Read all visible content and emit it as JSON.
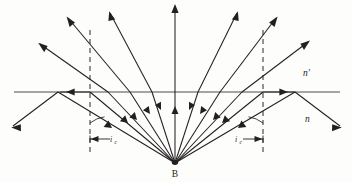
{
  "figure": {
    "background_color": "#fdfdfc",
    "ink_color": "#231f20",
    "interface_color": "#4d4d4f"
  },
  "labels": {
    "source_point": "B",
    "medium_upper": "n′",
    "medium_lower": "n",
    "critical_angle_left": "i",
    "critical_angle_left_sub": "c",
    "critical_angle_right": "i",
    "critical_angle_right_sub": "c"
  },
  "geometry": {
    "source": {
      "x": 175,
      "y": 163
    },
    "interface_y": 92,
    "interface_x_start": 14,
    "interface_x_end": 340,
    "normal_left_x": 90,
    "normal_right_x": 263,
    "normal_top_y": 30,
    "normal_bottom_y": 152,
    "tir_left_point": {
      "x": 58,
      "y": 92
    },
    "tir_right_point": {
      "x": 295,
      "y": 92
    },
    "critical_left_point": {
      "x": 90,
      "y": 92
    },
    "critical_right_point": {
      "x": 263,
      "y": 92
    }
  },
  "rays": {
    "count_from_source": 11,
    "description": "Eleven rays fan out from point source B in the denser medium n; rays inside the critical angle refract into n-prime bending away from the normal, the critical rays graze along the interface, and rays beyond the critical angle are totally internally reflected back into n.",
    "incident_endpoints": [
      {
        "id": "ray-tir-left",
        "x": 58,
        "y": 92,
        "type": "total-internal-reflection"
      },
      {
        "id": "ray-critical-left",
        "x": 90,
        "y": 92,
        "type": "critical-grazing"
      },
      {
        "id": "ray-refract-l3",
        "x": 108,
        "y": 92,
        "type": "refracted"
      },
      {
        "id": "ray-refract-l2",
        "x": 130,
        "y": 92,
        "type": "refracted"
      },
      {
        "id": "ray-refract-l1",
        "x": 152,
        "y": 92,
        "type": "refracted"
      },
      {
        "id": "ray-normal-center",
        "x": 175,
        "y": 92,
        "type": "undeviated"
      },
      {
        "id": "ray-refract-r1",
        "x": 198,
        "y": 92,
        "type": "refracted"
      },
      {
        "id": "ray-refract-r2",
        "x": 220,
        "y": 92,
        "type": "refracted"
      },
      {
        "id": "ray-refract-r3",
        "x": 242,
        "y": 92,
        "type": "refracted"
      },
      {
        "id": "ray-critical-right",
        "x": 263,
        "y": 92,
        "type": "critical-grazing"
      },
      {
        "id": "ray-tir-right",
        "x": 295,
        "y": 92,
        "type": "total-internal-reflection"
      }
    ],
    "refracted_endpoints": [
      {
        "id": "refr-l3-out",
        "x": 40,
        "y": 44
      },
      {
        "id": "refr-l2-out",
        "x": 68,
        "y": 18
      },
      {
        "id": "refr-l1-out",
        "x": 110,
        "y": 13
      },
      {
        "id": "refr-center-out",
        "x": 175,
        "y": 5
      },
      {
        "id": "refr-r1-out",
        "x": 237,
        "y": 13
      },
      {
        "id": "refr-r2-out",
        "x": 276,
        "y": 18
      },
      {
        "id": "refr-r3-out",
        "x": 308,
        "y": 42
      }
    ],
    "reflected_endpoints": [
      {
        "id": "tir-left-out",
        "x": 12,
        "y": 126
      },
      {
        "id": "tir-right-out",
        "x": 340,
        "y": 126
      }
    ],
    "grazing_arrow_left": {
      "x": 72,
      "y": 92,
      "direction": "left"
    },
    "grazing_arrow_right": {
      "x": 281,
      "y": 92,
      "direction": "right"
    }
  }
}
